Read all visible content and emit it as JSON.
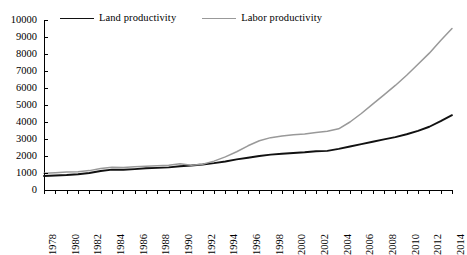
{
  "chart_data": {
    "type": "line",
    "title": "",
    "xlabel": "",
    "ylabel": "",
    "xlim": [
      1978,
      2014
    ],
    "ylim": [
      0,
      10000
    ],
    "grid": false,
    "legend_position": "top-left",
    "y_ticks": [
      0,
      1000,
      2000,
      3000,
      4000,
      5000,
      6000,
      7000,
      8000,
      9000,
      10000
    ],
    "y_tick_labels": [
      "0",
      "1000",
      "2000",
      "3000",
      "4000",
      "5000",
      "6000",
      "7000",
      "8000",
      "9000",
      "10000"
    ],
    "x_tick_labels": [
      "1978",
      "1980",
      "1982",
      "1984",
      "1986",
      "1988",
      "1990",
      "1992",
      "1994",
      "1996",
      "1998",
      "2000",
      "2002",
      "2004",
      "2006",
      "2008",
      "2010",
      "2012",
      "2014"
    ],
    "x": [
      1978,
      1979,
      1980,
      1981,
      1982,
      1983,
      1984,
      1985,
      1986,
      1987,
      1988,
      1989,
      1990,
      1991,
      1992,
      1993,
      1994,
      1995,
      1996,
      1997,
      1998,
      1999,
      2000,
      2001,
      2002,
      2003,
      2004,
      2005,
      2006,
      2007,
      2008,
      2009,
      2010,
      2011,
      2012,
      2013,
      2014
    ],
    "series": [
      {
        "name": "Land productivity",
        "color": "#111111",
        "values": [
          820,
          850,
          880,
          930,
          1000,
          1120,
          1200,
          1190,
          1230,
          1280,
          1300,
          1330,
          1400,
          1440,
          1500,
          1580,
          1680,
          1800,
          1900,
          2000,
          2080,
          2130,
          2180,
          2220,
          2280,
          2300,
          2420,
          2560,
          2700,
          2840,
          2980,
          3110,
          3280,
          3480,
          3720,
          4050,
          4400
        ]
      },
      {
        "name": "Labor productivity",
        "color": "#999999",
        "values": [
          980,
          1020,
          1060,
          1080,
          1140,
          1260,
          1340,
          1320,
          1370,
          1400,
          1420,
          1450,
          1540,
          1450,
          1520,
          1700,
          1950,
          2250,
          2600,
          2900,
          3080,
          3180,
          3250,
          3300,
          3380,
          3450,
          3600,
          4000,
          4500,
          5050,
          5600,
          6150,
          6750,
          7400,
          8050,
          8800,
          9500
        ]
      }
    ]
  },
  "legend": {
    "entries": [
      {
        "label": "Land productivity",
        "color": "#111111"
      },
      {
        "label": "Labor productivity",
        "color": "#999999"
      }
    ]
  }
}
